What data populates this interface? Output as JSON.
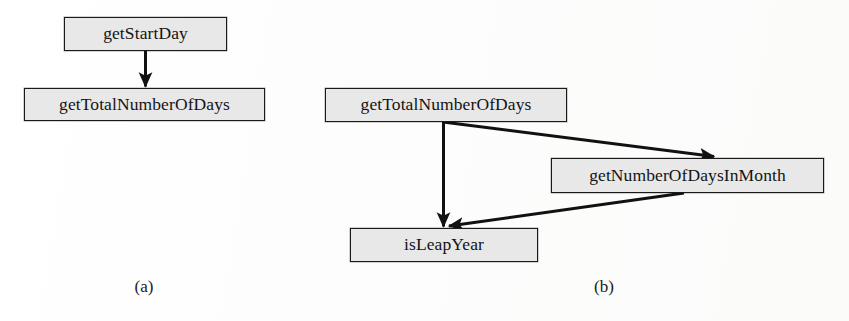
{
  "figure": {
    "background_color": "#fdfdfc",
    "node_fill_color": "#e8e8e8",
    "node_border_color": "#1a1a1a",
    "edge_color": "#111111"
  },
  "diagram_a": {
    "caption": "(a)",
    "nodes": [
      {
        "id": "a-getStartDay",
        "label": "getStartDay"
      },
      {
        "id": "a-getTotalNumberOfDays",
        "label": "getTotalNumberOfDays"
      }
    ],
    "edges": [
      {
        "from": "getStartDay",
        "to": "getTotalNumberOfDays",
        "style": "solid-arrow"
      }
    ]
  },
  "diagram_b": {
    "caption": "(b)",
    "nodes": [
      {
        "id": "b-getTotalNumberOfDays",
        "label": "getTotalNumberOfDays"
      },
      {
        "id": "b-getNumberOfDaysInMonth",
        "label": "getNumberOfDaysInMonth"
      },
      {
        "id": "b-isLeapYear",
        "label": "isLeapYear"
      }
    ],
    "edges": [
      {
        "from": "getTotalNumberOfDays",
        "to": "isLeapYear",
        "style": "solid-arrow"
      },
      {
        "from": "getTotalNumberOfDays",
        "to": "getNumberOfDaysInMonth",
        "style": "solid-arrow"
      },
      {
        "from": "getNumberOfDaysInMonth",
        "to": "isLeapYear",
        "style": "solid-arrow"
      }
    ]
  }
}
